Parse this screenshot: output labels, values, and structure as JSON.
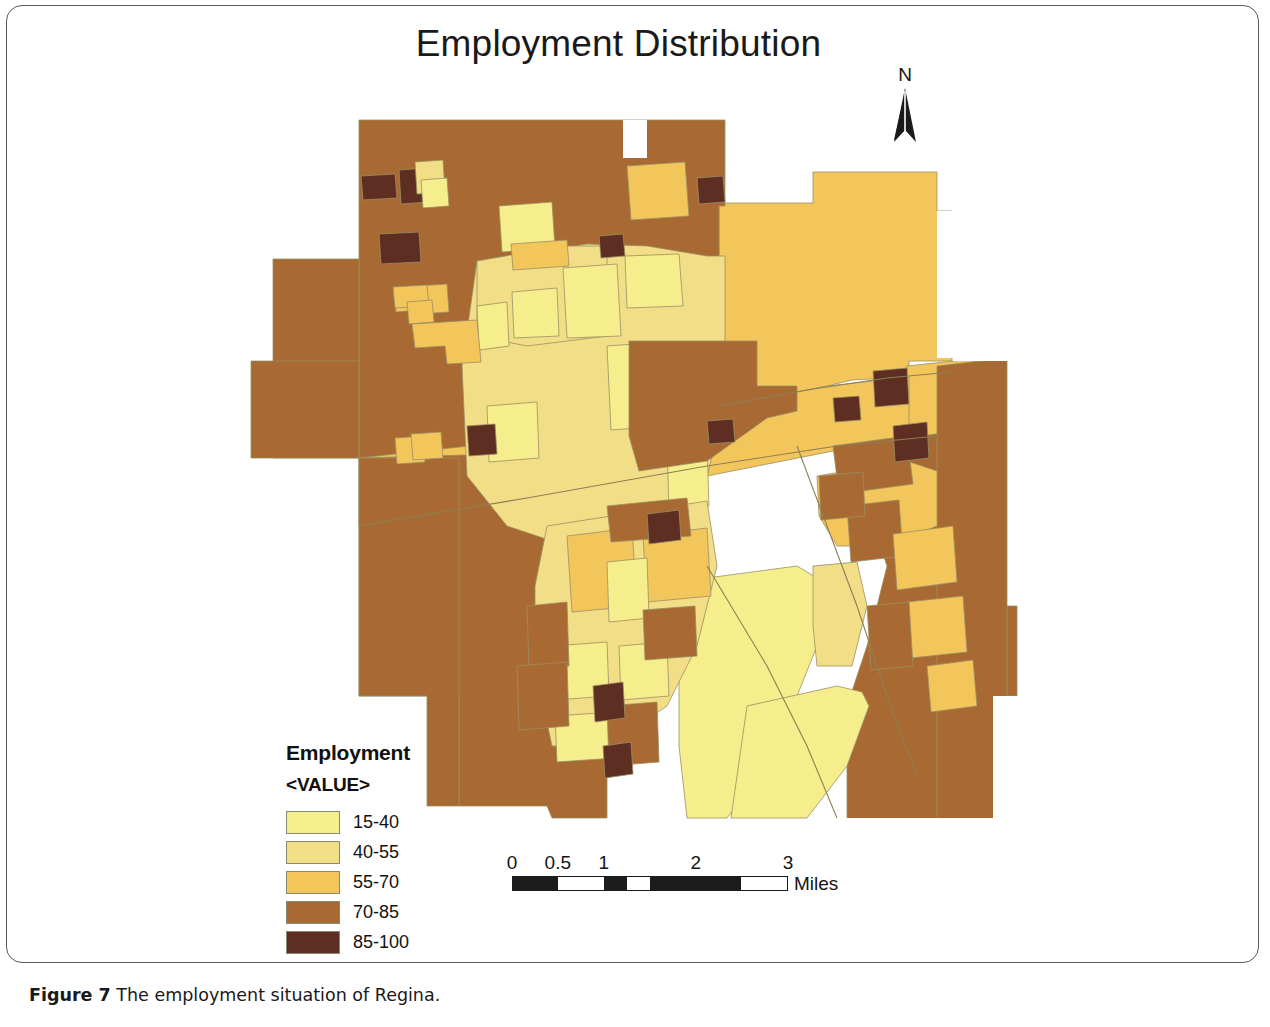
{
  "figure": {
    "caption_label": "Figure 7",
    "caption_text": "The employment situation of Regina."
  },
  "map": {
    "title": "Employment Distribution",
    "north_arrow_label": "N",
    "region_name": "Regina",
    "background_color": "#ffffff",
    "polygon_stroke_color": "#9a8f63"
  },
  "legend": {
    "title": "Employment",
    "subtitle": "<VALUE>",
    "classes": [
      {
        "label": "15-40",
        "color": "#F6EE8C",
        "min": 15,
        "max": 40
      },
      {
        "label": "40-55",
        "color": "#F2DE86",
        "min": 40,
        "max": 55
      },
      {
        "label": "55-70",
        "color": "#F3C65B",
        "min": 55,
        "max": 70
      },
      {
        "label": "70-85",
        "color": "#A86A32",
        "min": 70,
        "max": 85
      },
      {
        "label": "85-100",
        "color": "#5F2E22",
        "min": 85,
        "max": 100
      }
    ]
  },
  "scale_bar": {
    "unit_label": "Miles",
    "tick_labels": [
      "0",
      "0.5",
      "1",
      "2",
      "3"
    ],
    "tick_positions_pct": [
      0,
      16.6,
      33.3,
      66.6,
      100
    ],
    "segments": [
      {
        "fill": "dark",
        "width_pct": 16.6
      },
      {
        "fill": "light",
        "width_pct": 16.7
      },
      {
        "fill": "dark",
        "width_pct": 8.3
      },
      {
        "fill": "light",
        "width_pct": 8.4
      },
      {
        "fill": "dark",
        "width_pct": 33.3
      },
      {
        "fill": "light",
        "width_pct": 16.7
      }
    ]
  },
  "chart_data": {
    "type": "choropleth-map",
    "title": "Employment Distribution",
    "variable": "Employment",
    "value_field": "<VALUE>",
    "units": "percent",
    "legend_position": "lower-left",
    "scale_units": "Miles",
    "scale_max": 3,
    "class_breaks": [
      15,
      40,
      55,
      70,
      85,
      100
    ],
    "class_colors": [
      "#F6EE8C",
      "#F2DE86",
      "#F3C65B",
      "#A86A32",
      "#5F2E22"
    ],
    "class_labels": [
      "15-40",
      "40-55",
      "55-70",
      "70-85",
      "85-100"
    ],
    "regions": [
      {
        "name": "northwest-outer",
        "class": "70-85",
        "color": "#A86A32"
      },
      {
        "name": "north-central-block",
        "class": "70-85",
        "color": "#A86A32"
      },
      {
        "name": "northeast-large",
        "class": "55-70",
        "color": "#F3C65B"
      },
      {
        "name": "west-outer-band",
        "class": "70-85",
        "color": "#A86A32"
      },
      {
        "name": "southwest-block",
        "class": "70-85",
        "color": "#A86A32"
      },
      {
        "name": "central-core-mixed",
        "class": "40-55",
        "color": "#F2DE86"
      },
      {
        "name": "south-central-large",
        "class": "15-40",
        "color": "#F6EE8C"
      },
      {
        "name": "southeast-mixed",
        "class": "70-85",
        "color": "#A86A32"
      },
      {
        "name": "east-edge-band",
        "class": "70-85",
        "color": "#A86A32"
      },
      {
        "name": "scattered-high",
        "class": "85-100",
        "color": "#5F2E22"
      }
    ]
  }
}
